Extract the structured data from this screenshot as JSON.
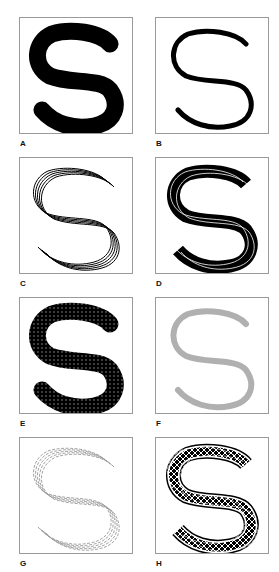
{
  "figure": {
    "letter": "S",
    "panels": [
      {
        "id": "A",
        "label": "A",
        "style": "thick-solid-black"
      },
      {
        "id": "B",
        "label": "B",
        "style": "thin-solid-black"
      },
      {
        "id": "C",
        "label": "C",
        "style": "parallel-line-contours"
      },
      {
        "id": "D",
        "label": "D",
        "style": "dense-black-multiline"
      },
      {
        "id": "E",
        "label": "E",
        "style": "dotted-texture-fill"
      },
      {
        "id": "F",
        "label": "F",
        "style": "gray-solid-stroke"
      },
      {
        "id": "G",
        "label": "G",
        "style": "gray-dashed-contours"
      },
      {
        "id": "H",
        "label": "H",
        "style": "crosshatch-fill-with-dashed-outline"
      }
    ],
    "colors": {
      "black": "#000000",
      "gray": "#b0b0b0",
      "border": "#9a9a9a"
    }
  }
}
